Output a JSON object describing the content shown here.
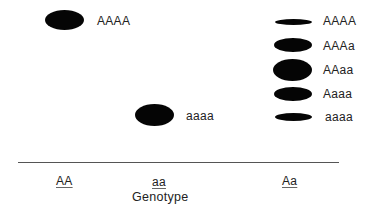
{
  "figure": {
    "type": "gel_electrophoresis_diagram",
    "axis_title": "Genotype",
    "colors": {
      "band": "#050505",
      "text": "#222222",
      "axis_line": "#555555",
      "background": "#ffffff"
    }
  },
  "lanes": [
    {
      "genotype": "AA",
      "bands": [
        {
          "label": "AAAA",
          "intensity": "strong"
        }
      ]
    },
    {
      "genotype": "aa",
      "bands": [
        {
          "label": "aaaa",
          "intensity": "strong"
        }
      ]
    },
    {
      "genotype": "Aa",
      "bands": [
        {
          "label": "AAAA",
          "intensity": "weak"
        },
        {
          "label": "AAAa",
          "intensity": "medium"
        },
        {
          "label": "AAaa",
          "intensity": "strong"
        },
        {
          "label": "Aaaa",
          "intensity": "medium"
        },
        {
          "label": "aaaa",
          "intensity": "weak"
        }
      ]
    }
  ]
}
